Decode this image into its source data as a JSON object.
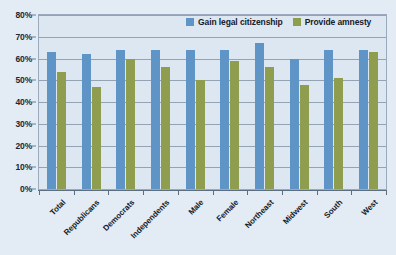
{
  "chart_data": {
    "type": "bar",
    "title": "",
    "xlabel": "",
    "ylabel": "",
    "ylim": [
      0,
      80
    ],
    "ytick_labels": [
      "0%",
      "10%",
      "20%",
      "30%",
      "40%",
      "50%",
      "60%",
      "70%",
      "80%"
    ],
    "ytick_values": [
      0,
      10,
      20,
      30,
      40,
      50,
      60,
      70,
      80
    ],
    "grid": true,
    "legend_position": "top-right",
    "categories": [
      "Total",
      "Republicans",
      "Democrats",
      "Independents",
      "Male",
      "Female",
      "Northeast",
      "Midwest",
      "South",
      "West"
    ],
    "series": [
      {
        "name": "Gain legal citizenship",
        "color": "#5f94c6",
        "values": [
          63,
          62,
          64,
          64,
          64,
          64,
          67,
          60,
          64,
          64
        ]
      },
      {
        "name": "Provide amnesty",
        "color": "#8f9d4e",
        "values": [
          54,
          47,
          60,
          56,
          50,
          59,
          56,
          48,
          51,
          63
        ]
      }
    ]
  }
}
